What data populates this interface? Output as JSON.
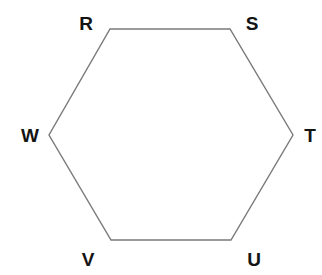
{
  "diagram": {
    "type": "hexagon",
    "stroke_color": "#7a7a7a",
    "label_color": "#141414",
    "vertices": [
      {
        "label": "R",
        "x": 110,
        "y": 29,
        "label_x": 86,
        "label_y": 30
      },
      {
        "label": "S",
        "x": 230,
        "y": 29,
        "label_x": 252,
        "label_y": 30
      },
      {
        "label": "T",
        "x": 293,
        "y": 135,
        "label_x": 310,
        "label_y": 142
      },
      {
        "label": "U",
        "x": 231,
        "y": 240,
        "label_x": 254,
        "label_y": 266
      },
      {
        "label": "V",
        "x": 111,
        "y": 240,
        "label_x": 88,
        "label_y": 266
      },
      {
        "label": "W",
        "x": 49,
        "y": 135,
        "label_x": 30,
        "label_y": 142
      }
    ],
    "edges": [
      {
        "from": "R",
        "to": "S"
      },
      {
        "from": "S",
        "to": "T"
      },
      {
        "from": "T",
        "to": "U"
      },
      {
        "from": "U",
        "to": "V"
      },
      {
        "from": "V",
        "to": "W"
      },
      {
        "from": "W",
        "to": "R"
      }
    ]
  }
}
